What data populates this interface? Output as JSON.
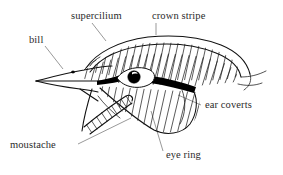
{
  "figure": {
    "background_color": "#ffffff",
    "ink_color": "#111111",
    "leader_color": "#6d6d6d",
    "text_color": "#2b2b2b"
  },
  "labels": [
    {
      "id": "supercilium",
      "text": "supercilium",
      "x": 71,
      "y": 19,
      "anchor": "start"
    },
    {
      "id": "crown-stripe",
      "text": "crown stripe",
      "x": 152,
      "y": 19,
      "anchor": "start"
    },
    {
      "id": "bill",
      "text": "bill",
      "x": 29,
      "y": 43,
      "anchor": "start"
    },
    {
      "id": "ear-coverts",
      "text": "ear coverts",
      "x": 205,
      "y": 108,
      "anchor": "start"
    },
    {
      "id": "moustache",
      "text": "moustache",
      "x": 10,
      "y": 148,
      "anchor": "start"
    },
    {
      "id": "eye-ring",
      "text": "eye ring",
      "x": 166,
      "y": 158,
      "anchor": "start"
    }
  ],
  "leader_lines": [
    {
      "id": "leader-supercilium",
      "path": "M 92 23 L 106 41"
    },
    {
      "id": "leader-crown-stripe",
      "path": "M 156 23 L 156 35"
    },
    {
      "id": "leader-bill",
      "path": "M 45 46 L 62 68"
    },
    {
      "id": "leader-ear-coverts",
      "path": "M 201 105 L 178 95"
    },
    {
      "id": "leader-moustache",
      "path": "M 78 144 L 130 119"
    },
    {
      "id": "leader-eye-ring",
      "path": "M 163 152 L 151 112"
    }
  ],
  "anatomy_parts": [
    {
      "id": "bill",
      "name": "bill",
      "description": "pointed beak, upper and lower mandible with nostril"
    },
    {
      "id": "supercilium",
      "name": "supercilium",
      "description": "pale stripe above the eye along the crown edge"
    },
    {
      "id": "crown-stripe",
      "name": "crown stripe",
      "description": "central stripe over the top of the crown"
    },
    {
      "id": "eye-ring",
      "name": "eye ring",
      "description": "pale almond ring encircling the eye"
    },
    {
      "id": "ear-coverts",
      "name": "ear coverts",
      "description": "hatched patch of feathers covering the ear below the eye stripe"
    },
    {
      "id": "moustache",
      "name": "moustache",
      "description": "hatched malar band running back from the base of the bill"
    },
    {
      "id": "eye-stripe",
      "name": "eye stripe",
      "description": "solid black stripe running through the eye"
    }
  ]
}
